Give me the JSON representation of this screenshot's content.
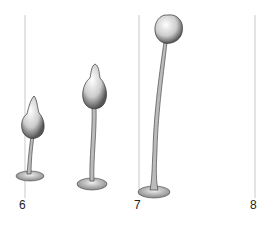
{
  "figure": {
    "stages": [
      {
        "label": "6",
        "x": 23
      },
      {
        "label": "7",
        "x": 138
      },
      {
        "label": "8",
        "x": 253
      }
    ],
    "colors": {
      "ink": "#222222",
      "guide": "#bbbbbb",
      "shade": "#999999"
    }
  }
}
